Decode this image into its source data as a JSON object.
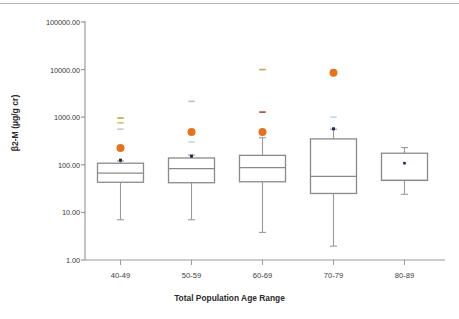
{
  "chart_data": {
    "type": "box",
    "title": "",
    "xlabel": "Total Population Age Range",
    "ylabel": "β2-M (µg/g cr)",
    "yscale": "log",
    "ylim": [
      1.0,
      100000.0
    ],
    "ytick_labels": [
      "100000.00",
      "10000.00",
      "1000.00",
      "100.00",
      "10.00",
      "1.00"
    ],
    "ytick_values": [
      100000,
      10000,
      1000,
      100,
      10,
      1
    ],
    "grid": false,
    "legend": "none",
    "categories": [
      "40-49",
      "50-59",
      "60-69",
      "70-79",
      "80-89"
    ],
    "boxes": [
      {
        "category": "40-49",
        "whisker_low": 7.0,
        "q1": 43.0,
        "median": 67.0,
        "q3": 108.0,
        "whisker_high": 120.0,
        "mean_marker": 125.0,
        "outliers": [
          {
            "value": 225.0,
            "color": "#e8721c",
            "shape": "circle-large"
          },
          {
            "value": 560.0,
            "color": "#c8c8c8",
            "shape": "dash"
          },
          {
            "value": 760.0,
            "color": "#d8c070",
            "shape": "dash"
          },
          {
            "value": 960.0,
            "color": "#b0ae3c",
            "shape": "dash"
          }
        ]
      },
      {
        "category": "50-59",
        "whisker_low": 7.0,
        "q1": 42.0,
        "median": 83.0,
        "q3": 139.0,
        "whisker_high": 160.0,
        "mean_marker": 152.0,
        "outliers": [
          {
            "value": 300.0,
            "color": "#bcd8ea",
            "shape": "dash"
          },
          {
            "value": 490.0,
            "color": "#e8721c",
            "shape": "circle-large"
          },
          {
            "value": 2150.0,
            "color": "#b9bfcf",
            "shape": "dash"
          }
        ]
      },
      {
        "category": "60-69",
        "whisker_low": 3.8,
        "q1": 44.0,
        "median": 87.0,
        "q3": 158.0,
        "whisker_high": 370.0,
        "mean_marker": 455.0,
        "outliers": [
          {
            "value": 455.0,
            "color": "#b07a50",
            "shape": "circle-small"
          },
          {
            "value": 490.0,
            "color": "#e8721c",
            "shape": "circle-large"
          },
          {
            "value": 1280.0,
            "color": "#c0392b",
            "shape": "dash"
          },
          {
            "value": 10000.0,
            "color": "#c8a44c",
            "shape": "dash"
          }
        ]
      },
      {
        "category": "70-79",
        "whisker_low": 1.95,
        "q1": 25.0,
        "median": 57.0,
        "q3": 350.0,
        "whisker_high": 560.0,
        "mean_marker": 570.0,
        "outliers": [
          {
            "value": 1000.0,
            "color": "#bcd8ea",
            "shape": "dash"
          },
          {
            "value": 8600.0,
            "color": "#e8721c",
            "shape": "circle-large"
          }
        ]
      },
      {
        "category": "80-89",
        "whisker_low": 24.0,
        "q1": 47.0,
        "median": 47.0,
        "q3": 175.0,
        "whisker_high": 230.0,
        "mean_marker": 108.0,
        "outliers": []
      }
    ],
    "colors": {
      "box_outline": "#8a8a8a",
      "whisker": "#9a9a9a",
      "median": "#8a8a8a",
      "mean_marker": "#1f2a52",
      "outlier_orange": "#e8721c",
      "axis": "#9a9a9a",
      "text": "#3b3b3b"
    }
  }
}
